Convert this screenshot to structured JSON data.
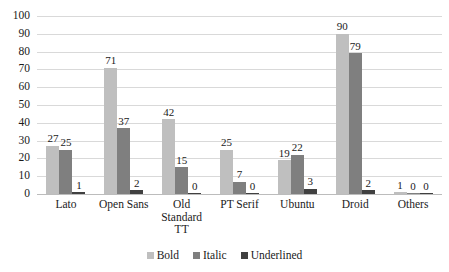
{
  "chart_data": {
    "type": "bar",
    "title": "",
    "subtitle": "",
    "xlabel": "",
    "ylabel": "",
    "ylim": [
      0,
      100
    ],
    "ytick_step": 10,
    "yticks": [
      100,
      90,
      80,
      70,
      60,
      50,
      40,
      30,
      20,
      10,
      0
    ],
    "grid": "horizontal",
    "legend_position": "bottom-center",
    "categories": [
      "Lato",
      "Open Sans",
      "Old Standard TT",
      "PT Serif",
      "Ubuntu",
      "Droid",
      "Others"
    ],
    "category_lines": [
      [
        "Lato"
      ],
      [
        "Open Sans"
      ],
      [
        "Old",
        "Standard",
        "TT"
      ],
      [
        "PT Serif"
      ],
      [
        "Ubuntu"
      ],
      [
        "Droid"
      ],
      [
        "Others"
      ]
    ],
    "series": [
      {
        "name": "Bold",
        "color": "#bfbfbf",
        "values": [
          27,
          71,
          42,
          25,
          19,
          90,
          1
        ]
      },
      {
        "name": "Italic",
        "color": "#7f7f7f",
        "values": [
          25,
          37,
          15,
          7,
          22,
          79,
          0
        ]
      },
      {
        "name": "Underlined",
        "color": "#404040",
        "values": [
          1,
          2,
          0,
          0,
          3,
          2,
          0
        ]
      }
    ],
    "data_labels": true
  },
  "legend": {
    "items": [
      {
        "label": "Bold"
      },
      {
        "label": "Italic"
      },
      {
        "label": "Underlined"
      }
    ]
  },
  "colors": {
    "bold": "#bfbfbf",
    "italic": "#7f7f7f",
    "underlined": "#404040",
    "gridline": "#d9d9d9",
    "axis": "#bcbcbc",
    "text": "#1a1a1a",
    "background": "#ffffff"
  }
}
